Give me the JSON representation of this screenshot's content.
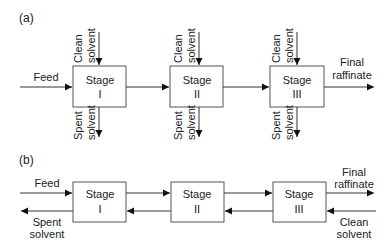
{
  "diagram": {
    "panel_a": {
      "label": "(a)",
      "title_type": "cross-current extraction",
      "feed_label": "Feed",
      "final_raffinate_label_1": "Final",
      "final_raffinate_label_2": "raffinate",
      "stages": [
        {
          "name": "Stage",
          "numeral": "I",
          "clean_1": "Clean",
          "clean_2": "solvent",
          "spent_1": "Spent",
          "spent_2": "solvent"
        },
        {
          "name": "Stage",
          "numeral": "II",
          "clean_1": "Clean",
          "clean_2": "solvent",
          "spent_1": "Spent",
          "spent_2": "solvent"
        },
        {
          "name": "Stage",
          "numeral": "III",
          "clean_1": "Clean",
          "clean_2": "solvent",
          "spent_1": "Spent",
          "spent_2": "solvent"
        }
      ]
    },
    "panel_b": {
      "label": "(b)",
      "title_type": "counter-current extraction",
      "feed_label": "Feed",
      "spent_solvent_1": "Spent",
      "spent_solvent_2": "solvent",
      "final_raffinate_1": "Final",
      "final_raffinate_2": "raffinate",
      "clean_solvent_1": "Clean",
      "clean_solvent_2": "solvent",
      "stages": [
        {
          "name": "Stage",
          "numeral": "I"
        },
        {
          "name": "Stage",
          "numeral": "II"
        },
        {
          "name": "Stage",
          "numeral": "III"
        }
      ]
    },
    "colors": {
      "line": "#333333",
      "box_border": "#555555",
      "text": "#222222",
      "background": "#ffffff"
    }
  }
}
